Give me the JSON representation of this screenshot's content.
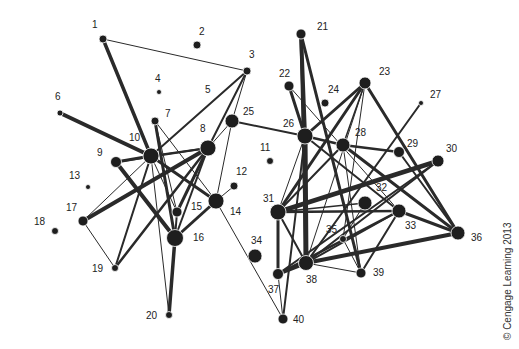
{
  "diagram": {
    "type": "network",
    "node_color": "#1e1e1e",
    "edge_color": "#2a2a2a",
    "nodes": [
      {
        "id": "1",
        "x": 103,
        "y": 39,
        "r": 4,
        "lx": 92,
        "ly": 28
      },
      {
        "id": "2",
        "x": 197,
        "y": 45,
        "r": 4,
        "lx": 199,
        "ly": 35
      },
      {
        "id": "3",
        "x": 247,
        "y": 71,
        "r": 4,
        "lx": 249,
        "ly": 58
      },
      {
        "id": "4",
        "x": 159,
        "y": 92,
        "r": 2.5,
        "lx": 155,
        "ly": 82
      },
      {
        "id": "5",
        "x": null,
        "y": null,
        "r": 0,
        "lx": 205,
        "ly": 93
      },
      {
        "id": "6",
        "x": 60,
        "y": 113,
        "r": 3,
        "lx": 55,
        "ly": 100
      },
      {
        "id": "7",
        "x": 155,
        "y": 121,
        "r": 4,
        "lx": 165,
        "ly": 117
      },
      {
        "id": "8",
        "x": 208,
        "y": 148,
        "r": 8,
        "lx": 200,
        "ly": 132
      },
      {
        "id": "9",
        "x": 116,
        "y": 162,
        "r": 5.5,
        "lx": 97,
        "ly": 156
      },
      {
        "id": "10",
        "x": 151,
        "y": 156,
        "r": 8,
        "lx": 129,
        "ly": 141
      },
      {
        "id": "11",
        "x": 270,
        "y": 161,
        "r": 3.5,
        "lx": 260,
        "ly": 151
      },
      {
        "id": "12",
        "x": 234,
        "y": 186,
        "r": 4,
        "lx": 236,
        "ly": 175
      },
      {
        "id": "13",
        "x": 88,
        "y": 187,
        "r": 2.5,
        "lx": 69,
        "ly": 179
      },
      {
        "id": "14",
        "x": 216,
        "y": 201,
        "r": 8,
        "lx": 230,
        "ly": 215
      },
      {
        "id": "15",
        "x": 177,
        "y": 212,
        "r": 5,
        "lx": 191,
        "ly": 210
      },
      {
        "id": "16",
        "x": 175,
        "y": 238,
        "r": 8.5,
        "lx": 193,
        "ly": 241
      },
      {
        "id": "17",
        "x": 83,
        "y": 221,
        "r": 5,
        "lx": 66,
        "ly": 211
      },
      {
        "id": "18",
        "x": 55,
        "y": 231,
        "r": 3.5,
        "lx": 34,
        "ly": 225
      },
      {
        "id": "19",
        "x": 115,
        "y": 268,
        "r": 3.5,
        "lx": 92,
        "ly": 272
      },
      {
        "id": "20",
        "x": 169,
        "y": 315,
        "r": 3.5,
        "lx": 146,
        "ly": 319
      },
      {
        "id": "21",
        "x": 301,
        "y": 34,
        "r": 5,
        "lx": 317,
        "ly": 30
      },
      {
        "id": "22",
        "x": 289,
        "y": 86,
        "r": 5,
        "lx": 279,
        "ly": 77
      },
      {
        "id": "23",
        "x": 365,
        "y": 83,
        "r": 6,
        "lx": 379,
        "ly": 75
      },
      {
        "id": "24",
        "x": 325,
        "y": 103,
        "r": 4,
        "lx": 328,
        "ly": 93
      },
      {
        "id": "25",
        "x": 232,
        "y": 121,
        "r": 7,
        "lx": 243,
        "ly": 115
      },
      {
        "id": "26",
        "x": 305,
        "y": 136,
        "r": 8,
        "lx": 283,
        "ly": 127
      },
      {
        "id": "27",
        "x": 421,
        "y": 103,
        "r": 2.5,
        "lx": 430,
        "ly": 98
      },
      {
        "id": "28",
        "x": 343,
        "y": 145,
        "r": 7,
        "lx": 355,
        "ly": 136
      },
      {
        "id": "29",
        "x": 399,
        "y": 152,
        "r": 5.5,
        "lx": 407,
        "ly": 147
      },
      {
        "id": "30",
        "x": 438,
        "y": 161,
        "r": 6,
        "lx": 446,
        "ly": 152
      },
      {
        "id": "31",
        "x": 278,
        "y": 212,
        "r": 8,
        "lx": 263,
        "ly": 202
      },
      {
        "id": "32",
        "x": 365,
        "y": 203,
        "r": 7,
        "lx": 376,
        "ly": 191
      },
      {
        "id": "33",
        "x": 399,
        "y": 211,
        "r": 7,
        "lx": 405,
        "ly": 229
      },
      {
        "id": "34",
        "x": 255,
        "y": 256,
        "r": 7,
        "lx": 251,
        "ly": 244
      },
      {
        "id": "35",
        "x": 343,
        "y": 239,
        "r": 3.5,
        "lx": 326,
        "ly": 233
      },
      {
        "id": "36",
        "x": 458,
        "y": 233,
        "r": 7,
        "lx": 471,
        "ly": 241
      },
      {
        "id": "37",
        "x": 278,
        "y": 274,
        "r": 5.5,
        "lx": 268,
        "ly": 293
      },
      {
        "id": "38",
        "x": 306,
        "y": 263,
        "r": 7.5,
        "lx": 306,
        "ly": 283
      },
      {
        "id": "39",
        "x": 361,
        "y": 273,
        "r": 5,
        "lx": 373,
        "ly": 276
      },
      {
        "id": "40",
        "x": 283,
        "y": 319,
        "r": 5,
        "lx": 293,
        "ly": 323
      }
    ],
    "edges": [
      {
        "a": "1",
        "b": "3",
        "w": 1
      },
      {
        "a": "1",
        "b": "10",
        "w": 3.5
      },
      {
        "a": "6",
        "b": "10",
        "w": 4
      },
      {
        "a": "3",
        "b": "10",
        "w": 2
      },
      {
        "a": "3",
        "b": "8",
        "w": 2
      },
      {
        "a": "3",
        "b": "25",
        "w": 1
      },
      {
        "a": "9",
        "b": "10",
        "w": 3
      },
      {
        "a": "9",
        "b": "16",
        "w": 4
      },
      {
        "a": "10",
        "b": "8",
        "w": 2
      },
      {
        "a": "10",
        "b": "14",
        "w": 3
      },
      {
        "a": "10",
        "b": "15",
        "w": 1
      },
      {
        "a": "10",
        "b": "20",
        "w": 1
      },
      {
        "a": "10",
        "b": "19",
        "w": 2
      },
      {
        "a": "10",
        "b": "17",
        "w": 1
      },
      {
        "a": "7",
        "b": "16",
        "w": 3
      },
      {
        "a": "7",
        "b": "14",
        "w": 1
      },
      {
        "a": "7",
        "b": "15",
        "w": 1
      },
      {
        "a": "8",
        "b": "17",
        "w": 4
      },
      {
        "a": "8",
        "b": "9",
        "w": 2
      },
      {
        "a": "8",
        "b": "19",
        "w": 2.5
      },
      {
        "a": "8",
        "b": "15",
        "w": 3
      },
      {
        "a": "8",
        "b": "16",
        "w": 2
      },
      {
        "a": "8",
        "b": "25",
        "w": 1
      },
      {
        "a": "25",
        "b": "26",
        "w": 2
      },
      {
        "a": "25",
        "b": "14",
        "w": 1
      },
      {
        "a": "12",
        "b": "14",
        "w": 1
      },
      {
        "a": "14",
        "b": "16",
        "w": 3
      },
      {
        "a": "14",
        "b": "40",
        "w": 1
      },
      {
        "a": "15",
        "b": "16",
        "w": 2
      },
      {
        "a": "16",
        "b": "20",
        "w": 3.5
      },
      {
        "a": "17",
        "b": "19",
        "w": 1
      },
      {
        "a": "21",
        "b": "26",
        "w": 4
      },
      {
        "a": "21",
        "b": "39",
        "w": 3
      },
      {
        "a": "21",
        "b": "38",
        "w": 3
      },
      {
        "a": "22",
        "b": "26",
        "w": 3
      },
      {
        "a": "22",
        "b": "33",
        "w": 1
      },
      {
        "a": "23",
        "b": "26",
        "w": 3
      },
      {
        "a": "23",
        "b": "31",
        "w": 3
      },
      {
        "a": "23",
        "b": "28",
        "w": 1.5
      },
      {
        "a": "23",
        "b": "35",
        "w": 1
      },
      {
        "a": "23",
        "b": "36",
        "w": 3
      },
      {
        "a": "23",
        "b": "38",
        "w": 1
      },
      {
        "a": "27",
        "b": "38",
        "w": 2
      },
      {
        "a": "26",
        "b": "28",
        "w": 2.5
      },
      {
        "a": "26",
        "b": "31",
        "w": 1
      },
      {
        "a": "26",
        "b": "38",
        "w": 5
      },
      {
        "a": "26",
        "b": "33",
        "w": 2
      },
      {
        "a": "28",
        "b": "29",
        "w": 2.5
      },
      {
        "a": "28",
        "b": "31",
        "w": 2
      },
      {
        "a": "28",
        "b": "36",
        "w": 3
      },
      {
        "a": "28",
        "b": "39",
        "w": 1
      },
      {
        "a": "30",
        "b": "31",
        "w": 4.5
      },
      {
        "a": "30",
        "b": "37",
        "w": 2
      },
      {
        "a": "30",
        "b": "38",
        "w": 2
      },
      {
        "a": "31",
        "b": "32",
        "w": 1.5
      },
      {
        "a": "31",
        "b": "33",
        "w": 2.5
      },
      {
        "a": "31",
        "b": "37",
        "w": 3
      },
      {
        "a": "31",
        "b": "38",
        "w": 2
      },
      {
        "a": "32",
        "b": "35",
        "w": 1
      },
      {
        "a": "33",
        "b": "36",
        "w": 3
      },
      {
        "a": "33",
        "b": "37",
        "w": 2.5
      },
      {
        "a": "33",
        "b": "38",
        "w": 2
      },
      {
        "a": "33",
        "b": "39",
        "w": 2
      },
      {
        "a": "35",
        "b": "39",
        "w": 1
      },
      {
        "a": "36",
        "b": "38",
        "w": 4
      },
      {
        "a": "36",
        "b": "29",
        "w": 2
      },
      {
        "a": "37",
        "b": "38",
        "w": 4
      },
      {
        "a": "38",
        "b": "39",
        "w": 1
      },
      {
        "a": "26",
        "b": "40",
        "w": 2
      },
      {
        "a": "37",
        "b": "40",
        "w": 1
      }
    ]
  },
  "copyright": "© Cengage Learning 2013"
}
